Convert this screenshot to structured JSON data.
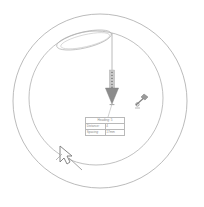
{
  "diagram": {
    "background_color": "#ffffff",
    "stroke_color": "#9a9a9a",
    "arrow_color": "#808080",
    "cursor_color": "#7a7a7a",
    "outer_circle": {
      "cx": 100,
      "cy": 101,
      "r": 87
    },
    "inner_circle": {
      "cx": 96,
      "cy": 98,
      "r": 68
    },
    "ellipse": {
      "cx": 84,
      "cy": 40,
      "rx": 28,
      "ry": 8,
      "rotation": -12
    }
  },
  "annotations": {
    "down_arrow": {
      "name": "down-arrow",
      "x": 112,
      "top_y": 33,
      "bottom_y": 117,
      "head_top_y": 88,
      "head_bottom_y": 104,
      "dotted_from_y": 70,
      "dotted_to_y": 88
    },
    "cursor": {
      "name": "mouse-cursor",
      "x": 62,
      "y": 150,
      "label": ""
    },
    "tool_marker": {
      "name": "tool-marker",
      "x": 139,
      "y": 100,
      "label": ""
    }
  },
  "table": {
    "title": "Heading: 5",
    "rows": [
      {
        "label": "Distance:",
        "value": "4"
      },
      {
        "label": "Spacing:",
        "value": "17mm"
      }
    ]
  }
}
